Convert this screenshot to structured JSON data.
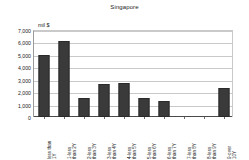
{
  "chart_data": {
    "type": "bar",
    "title": "Singapore",
    "xlabel": "",
    "ylabel": "",
    "unit_label": "mil $",
    "grid": true,
    "legend": false,
    "ylim": [
      0,
      7000
    ],
    "ytick_labels": [
      "7,000",
      "6,000",
      "5,000",
      "4,000",
      "3,000",
      "2,000",
      "1,000",
      "0"
    ],
    "ytick_values": [
      7000,
      6000,
      5000,
      4000,
      3000,
      2000,
      1000,
      0
    ],
    "categories": [
      "less than 1Y",
      "1-less than 2Y",
      "2-less than 3Y",
      "3-less than 4Y",
      "4-less than 5Y",
      "5-less than 6Y",
      "6-less than 7Y",
      "7-less than 8Y",
      "8-less than 9Y",
      "9-over 10Y"
    ],
    "category_lines": [
      [
        "less than",
        "1Y"
      ],
      [
        "1-less",
        "than 2Y"
      ],
      [
        "2-less",
        "than 3Y"
      ],
      [
        "3-less",
        "than 4Y"
      ],
      [
        "4-less",
        "than 5Y"
      ],
      [
        "5-less",
        "than 6Y"
      ],
      [
        "6-less",
        "than 7Y"
      ],
      [
        "7-less",
        "than 8Y"
      ],
      [
        "8-less",
        "than 9Y"
      ],
      [
        "9-over",
        "10Y"
      ]
    ],
    "values": [
      4950,
      6150,
      1550,
      2650,
      2700,
      1500,
      1300,
      0,
      0,
      2350
    ],
    "bar_color": "#3a3a3a",
    "grid_color": "#c9c9c9",
    "axis_color": "#4a4a4a"
  }
}
